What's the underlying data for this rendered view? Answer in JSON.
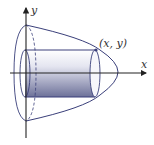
{
  "diagram": {
    "axes": {
      "x_label": "x",
      "y_label": "y"
    },
    "point_label": "(x, y)",
    "colors": {
      "outline": "#3a3f7a",
      "axis": "#222222",
      "cylinder_light": "#f4f4fa",
      "cylinder_dark": "#6a6f9e"
    }
  }
}
